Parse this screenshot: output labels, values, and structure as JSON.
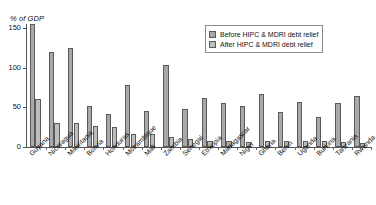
{
  "chart_data": {
    "type": "bar",
    "title": "",
    "subtitle": "",
    "xlabel": "",
    "ylabel": "% of GDP",
    "ylim": [
      0,
      160
    ],
    "yticks": [
      0,
      50,
      100,
      150
    ],
    "ytick_labels": [
      "0",
      "50",
      "100",
      "150"
    ],
    "grid": false,
    "legend_position": "top-right",
    "categories": [
      "Guyana",
      "Nicaragua",
      "Mauritania",
      "Bolivia",
      "Honduras",
      "Mozambique",
      "Mali",
      "Zambia",
      "Senegal",
      "Ethiopia",
      "Madagascar",
      "Niger",
      "Ghana",
      "Benin",
      "Uganda",
      "Burkina",
      "Tanzania",
      "Rwanda"
    ],
    "series": [
      {
        "name": "Before HIPC & MDRI debt relief",
        "color": "#a8a8a8",
        "values": [
          155,
          120,
          125,
          52,
          42,
          78,
          45,
          103,
          48,
          62,
          55,
          52,
          67,
          44,
          57,
          38,
          56,
          64
        ]
      },
      {
        "name": "After HIPC & MDRI debt relief",
        "color": "#bdbdbd",
        "values": [
          60,
          30,
          30,
          26,
          25,
          16,
          16,
          12,
          10,
          8,
          7,
          6,
          8,
          7,
          7,
          7,
          6,
          5
        ]
      }
    ]
  },
  "legend": {
    "entries": [
      {
        "label": "Before HIPC & MDRI debt relief",
        "key": "before"
      },
      {
        "label": "After HIPC & MDRI debt relief",
        "key": "after"
      }
    ]
  },
  "axes": {
    "y_title": "% of GDP"
  },
  "colors": {
    "before": "#a8a8a8",
    "after": "#bdbdbd",
    "axis": "#555555",
    "text": "#111111",
    "background": "#ffffff"
  }
}
